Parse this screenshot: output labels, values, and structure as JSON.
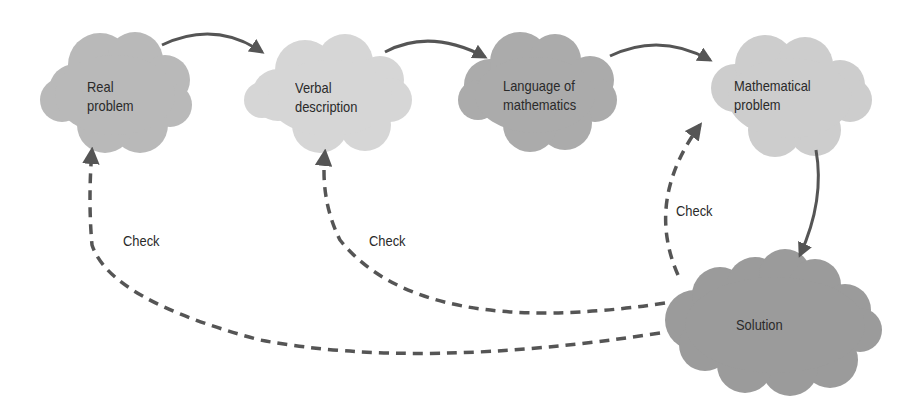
{
  "diagram": {
    "type": "flow",
    "nodes": [
      {
        "id": "real",
        "line1": "Real",
        "line2": "problem",
        "color": "#b9b9b9"
      },
      {
        "id": "verbal",
        "line1": "Verbal",
        "line2": "description",
        "color": "#d6d6d6"
      },
      {
        "id": "language",
        "line1": "Language of",
        "line2": "mathematics",
        "color": "#ababab"
      },
      {
        "id": "math",
        "line1": "Mathematical",
        "line2": "problem",
        "color": "#cdcdcd"
      },
      {
        "id": "solution",
        "line1": "Solution",
        "line2": "",
        "color": "#9b9b9b"
      }
    ],
    "edges": [
      {
        "from": "real",
        "to": "verbal",
        "style": "solid"
      },
      {
        "from": "verbal",
        "to": "language",
        "style": "solid"
      },
      {
        "from": "language",
        "to": "math",
        "style": "solid"
      },
      {
        "from": "math",
        "to": "solution",
        "style": "solid"
      },
      {
        "from": "solution",
        "to": "math",
        "style": "dashed",
        "label": "Check"
      },
      {
        "from": "solution",
        "to": "verbal",
        "style": "dashed",
        "label": "Check"
      },
      {
        "from": "solution",
        "to": "real",
        "style": "dashed",
        "label": "Check"
      }
    ],
    "check_labels": [
      "Check",
      "Check",
      "Check"
    ],
    "arrow_color": "#555555"
  }
}
